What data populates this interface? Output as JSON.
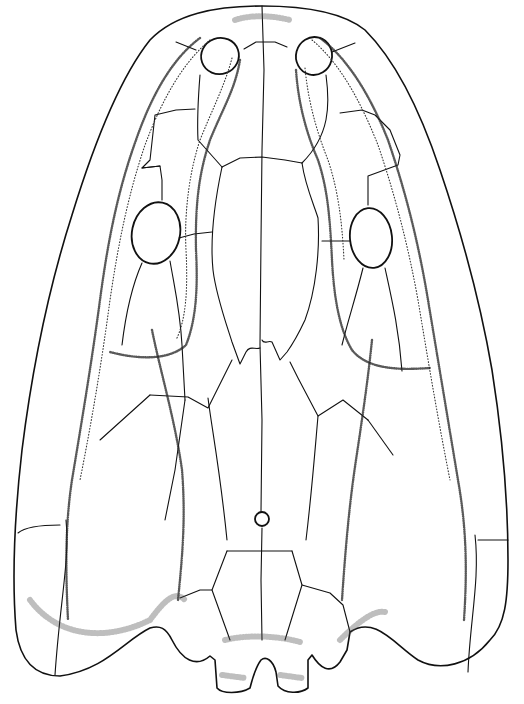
{
  "figure": {
    "style": "stippled-ink-illustration",
    "colors": {
      "background": "#ffffff",
      "ink": "#111111"
    }
  },
  "labels": []
}
